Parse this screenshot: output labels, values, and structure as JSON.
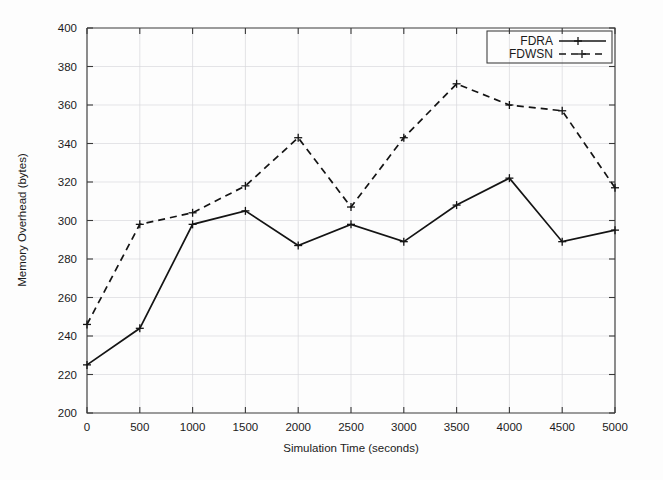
{
  "chart_data": {
    "type": "line",
    "title": "",
    "xlabel": "Simulation Time (seconds)",
    "ylabel": "Memory Overhead (bytes)",
    "xlim": [
      0,
      5000
    ],
    "ylim": [
      200,
      400
    ],
    "xticks": [
      0,
      500,
      1000,
      1500,
      2000,
      2500,
      3000,
      3500,
      4000,
      4500,
      5000
    ],
    "yticks": [
      200,
      220,
      240,
      260,
      280,
      300,
      320,
      340,
      360,
      380,
      400
    ],
    "xtick_labels": [
      "0",
      "500",
      "1000",
      "1500",
      "2000",
      "2500",
      "3000",
      "3500",
      "4000",
      "4500",
      "5000"
    ],
    "ytick_labels": [
      "200",
      "220",
      "240",
      "260",
      "280",
      "300",
      "320",
      "340",
      "360",
      "380",
      "400"
    ],
    "grid": true,
    "legend_position": "top-right",
    "x": [
      0,
      500,
      1000,
      1500,
      2000,
      2500,
      3000,
      3500,
      4000,
      4500,
      5000
    ],
    "series": [
      {
        "name": "FDRA",
        "style": "solid",
        "marker": "plus",
        "color": "#141414",
        "values": [
          225,
          244,
          298,
          305,
          287,
          298,
          289,
          308,
          322,
          289,
          295
        ]
      },
      {
        "name": "FDWSN",
        "style": "dashed",
        "marker": "plus",
        "color": "#141414",
        "values": [
          246,
          298,
          304,
          318,
          343,
          307,
          343,
          371,
          360,
          357,
          317
        ]
      }
    ]
  },
  "legend": {
    "entries": [
      {
        "label": "FDRA"
      },
      {
        "label": "FDWSN"
      }
    ]
  },
  "axes": {
    "x_title": "Simulation Time (seconds)",
    "y_title": "Memory Overhead (bytes)"
  }
}
